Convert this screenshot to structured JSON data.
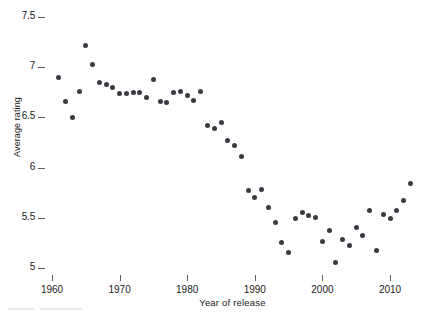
{
  "figure": {
    "background_color": "#ffffff",
    "marker_color": "#3a3a42",
    "axis_color": "#5c5c5c",
    "text_color": "#1a1a1a"
  },
  "chart_data": {
    "type": "scatter",
    "title": "",
    "xlabel": "Year of release",
    "ylabel": "Average rating",
    "xlim": [
      1959,
      2014
    ],
    "ylim": [
      5,
      7.5
    ],
    "grid": false,
    "legend": null,
    "xticks": [
      1960,
      1970,
      1980,
      1990,
      2000,
      2010
    ],
    "xticklabels": [
      "1960",
      "1970",
      "1980",
      "1990",
      "2000",
      "2010"
    ],
    "yticks": [
      5,
      5.5,
      6,
      6.5,
      7,
      7.5
    ],
    "yticklabels": [
      "5",
      "5.5",
      "6",
      "6.5",
      "7",
      "7.5"
    ],
    "series": [
      {
        "name": "Average rating by year of release",
        "marker": "circle",
        "color": "#3a3a42",
        "x": [
          1961,
          1962,
          1963,
          1964,
          1965,
          1966,
          1967,
          1968,
          1969,
          1970,
          1971,
          1972,
          1973,
          1974,
          1975,
          1976,
          1977,
          1978,
          1979,
          1980,
          1981,
          1982,
          1983,
          1984,
          1985,
          1986,
          1987,
          1988,
          1989,
          1990,
          1991,
          1992,
          1993,
          1994,
          1995,
          1996,
          1997,
          1998,
          1999,
          2000,
          2001,
          2002,
          2003,
          2004,
          2005,
          2006,
          2007,
          2008,
          2009,
          2010,
          2011,
          2012,
          2013
        ],
        "y": [
          6.9,
          6.66,
          6.5,
          6.76,
          7.22,
          7.03,
          6.85,
          6.83,
          6.8,
          6.74,
          6.74,
          6.75,
          6.75,
          6.7,
          6.88,
          6.66,
          6.65,
          6.75,
          6.76,
          6.72,
          6.67,
          6.76,
          6.42,
          6.39,
          6.45,
          6.27,
          6.22,
          6.11,
          5.77,
          5.7,
          5.78,
          5.6,
          5.45,
          5.25,
          5.15,
          5.49,
          5.55,
          5.52,
          5.5,
          5.26,
          5.37,
          5.05,
          5.28,
          5.22,
          5.4,
          5.32,
          5.57,
          5.17,
          5.53,
          5.49,
          5.57,
          5.67,
          5.84
        ]
      }
    ]
  }
}
